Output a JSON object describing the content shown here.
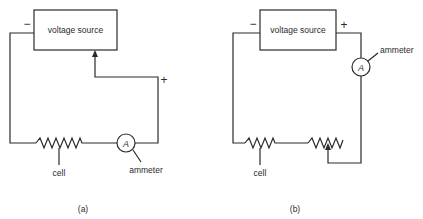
{
  "panels": [
    {
      "id": "a",
      "caption": "(a)",
      "source_label": "voltage source",
      "minus_sign": "−",
      "plus_sign": "+",
      "meter_symbol": "A",
      "cell_label": "cell",
      "ammeter_label": "ammeter"
    },
    {
      "id": "b",
      "caption": "(b)",
      "source_label": "voltage source",
      "minus_sign": "−",
      "plus_sign": "+",
      "meter_symbol": "A",
      "cell_label": "cell",
      "ammeter_label": "ammeter"
    }
  ],
  "colors": {
    "line": "#2a2a2a",
    "background": "#ffffff"
  }
}
